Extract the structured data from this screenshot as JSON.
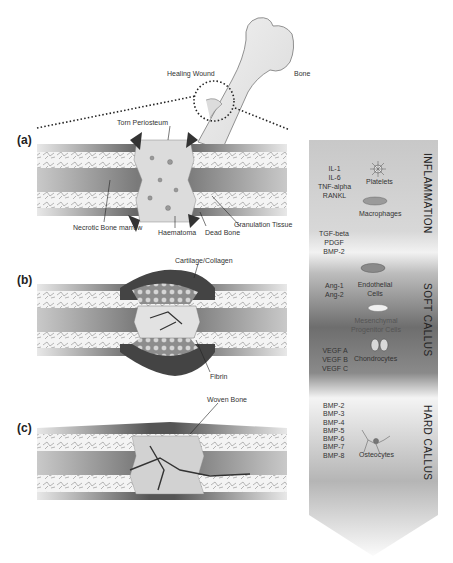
{
  "overview": {
    "healing_wound_label": "Healing Wound",
    "bone_label": "Bone"
  },
  "panels": [
    {
      "letter": "(a)",
      "labels": {
        "torn_periosteum": "Torn Periosteum",
        "necrotic_bone_marrow": "Necrotic Bone marrow",
        "haematoma": "Haematoma",
        "dead_bone": "Dead Bone",
        "granulation_tissue": "Granulation Tissue"
      }
    },
    {
      "letter": "(b)",
      "labels": {
        "cartilage_collagen": "Cartilage/Collagen",
        "fibrin": "Fibrin"
      }
    },
    {
      "letter": "(c)",
      "labels": {
        "woven_bone": "Woven Bone"
      }
    }
  ],
  "timeline": {
    "stages": [
      "INFLAMMATION",
      "SOFT CALLUS",
      "HARD CALLUS"
    ],
    "factors": {
      "inflammation_1": [
        "IL-1",
        "IL-6",
        "TNF-alpha",
        "RANKL"
      ],
      "inflammation_2": [
        "TGF-beta",
        "PDGF",
        "BMP-2"
      ],
      "soft_1": [
        "Ang-1",
        "Ang-2"
      ],
      "soft_2": [
        "VEGF A",
        "VEGF B",
        "VEGF C"
      ],
      "hard": [
        "BMP-2",
        "BMP-3",
        "BMP-4",
        "BMP-5",
        "BMP-6",
        "BMP-7",
        "BMP-8"
      ]
    },
    "cells": {
      "platelets": "Platelets",
      "macrophages": "Macrophages",
      "endothelial": "Endothelial Cells",
      "mesenchymal": "Mesenchymal Progenitor Cells",
      "chondrocytes": "Chondrocytes",
      "osteocytes": "Osteocytes"
    }
  }
}
